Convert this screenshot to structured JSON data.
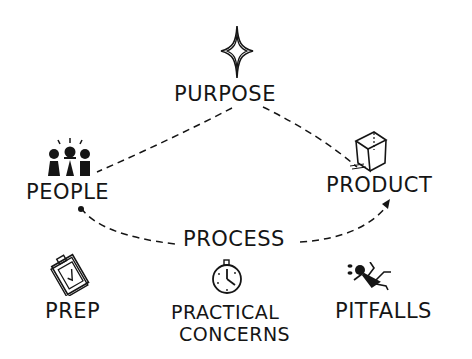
{
  "diagram": {
    "nodes": {
      "purpose": {
        "label": "PURPOSE",
        "icon": "sparkle-star-icon"
      },
      "people": {
        "label": "PEOPLE",
        "icon": "people-group-icon"
      },
      "product": {
        "label": "PRODUCT",
        "icon": "cube-icon"
      },
      "process": {
        "label": "PROCESS"
      }
    },
    "footer": [
      {
        "label": "PREP",
        "icon": "clipboard-check-icon"
      },
      {
        "label_line1": "PRACTICAL",
        "label_line2": "CONCERNS",
        "icon": "stopwatch-icon"
      },
      {
        "label": "PITFALLS",
        "icon": "falling-person-icon"
      }
    ],
    "edges": [
      {
        "from": "purpose",
        "to": "people",
        "style": "dashed"
      },
      {
        "from": "purpose",
        "to": "product",
        "style": "dashed"
      },
      {
        "from": "people",
        "to": "product",
        "style": "dashed-arrow",
        "label": "PROCESS"
      }
    ],
    "colors": {
      "ink": "#151515",
      "background": "#ffffff"
    }
  }
}
